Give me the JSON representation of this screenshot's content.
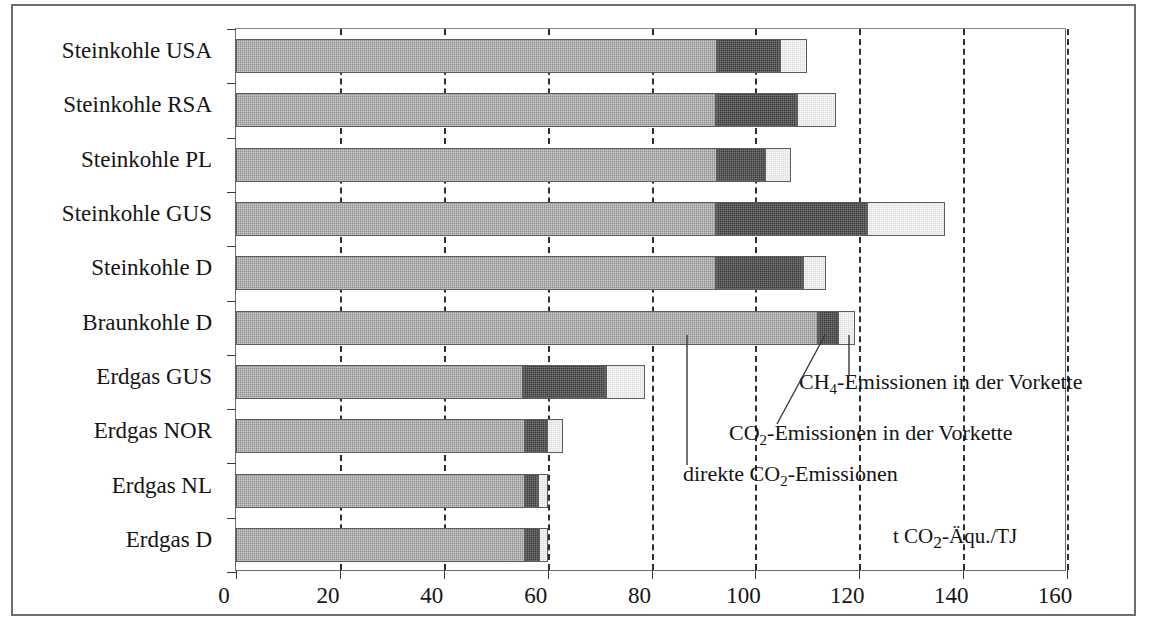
{
  "chart_data": {
    "type": "bar",
    "orientation": "horizontal",
    "stacked": true,
    "title": "",
    "xlabel": "",
    "ylabel": "",
    "unit_note": "t CO2-Äqu./TJ",
    "xlim": [
      0,
      160
    ],
    "xticks": [
      0,
      20,
      40,
      60,
      80,
      100,
      120,
      140,
      160
    ],
    "xticklabels": [
      "0",
      "20",
      "40",
      "60",
      "80",
      "100",
      "120",
      "140",
      "160"
    ],
    "grid": "vertical dashed gridlines at every x tick",
    "legend_position": "inline annotations with leader lines",
    "categories": [
      "Steinkohle USA",
      "Steinkohle RSA",
      "Steinkohle PL",
      "Steinkohle GUS",
      "Steinkohle D",
      "Braunkohle D",
      "Erdgas GUS",
      "Erdgas NOR",
      "Erdgas NL",
      "Erdgas D"
    ],
    "series": [
      {
        "name": "direkte CO2-Emissionen",
        "key": "direct",
        "color": "#8f8f8f",
        "values": [
          92.6,
          92.5,
          92.6,
          92.5,
          92.5,
          112.1,
          55.3,
          55.6,
          55.6,
          55.6
        ]
      },
      {
        "name": "CO2-Emissionen in der Vorkette",
        "key": "co2pre",
        "color": "#3a3a3a",
        "values": [
          12.1,
          15.6,
          9.2,
          28.9,
          16.7,
          3.9,
          15.9,
          4.2,
          2.5,
          2.7
        ]
      },
      {
        "name": "CH4-Emissionen in der Vorkette",
        "key": "ch4pre",
        "color": "#dedede",
        "values": [
          5.2,
          7.4,
          5.0,
          15.2,
          4.4,
          3.2,
          7.6,
          3.2,
          2.0,
          1.8
        ]
      }
    ],
    "totals": [
      109.9,
      115.5,
      106.8,
      136.6,
      113.6,
      119.2,
      78.8,
      63.0,
      60.1,
      60.1
    ]
  },
  "annotations": [
    {
      "id": "ch4-vorkette",
      "text_parts": {
        "pre": "CH",
        "sub": "4",
        "post": "-Emissionen in der Vorkette"
      },
      "plain": "CH4-Emissionen in der Vorkette",
      "target_series": "ch4pre",
      "target_category": "Braunkohle D"
    },
    {
      "id": "co2-vorkette",
      "text_parts": {
        "pre": "CO",
        "sub": "2",
        "post": "-Emissionen in der Vorkette"
      },
      "plain": "CO2-Emissionen in der Vorkette",
      "target_series": "co2pre",
      "target_category": "Braunkohle D"
    },
    {
      "id": "direkte-co2",
      "text_parts": {
        "pre": "direkte CO",
        "sub": "2",
        "post": "-Emissionen"
      },
      "plain": "direkte CO2-Emissionen",
      "target_series": "direct",
      "target_category": "Braunkohle D"
    }
  ],
  "unit_label": {
    "pre": "t CO",
    "sub": "2",
    "post": "-Äqu./TJ",
    "plain": "t CO2-Äqu./TJ"
  },
  "colors": {
    "direct": "#8f8f8f",
    "co2_vorkette": "#3a3a3a",
    "ch4_vorkette": "#dedede",
    "frame": "#6d6d6d",
    "axis": "#3a3a3a",
    "gridline": "#2f2f2f",
    "text": "#141414",
    "background": "#ffffff"
  }
}
